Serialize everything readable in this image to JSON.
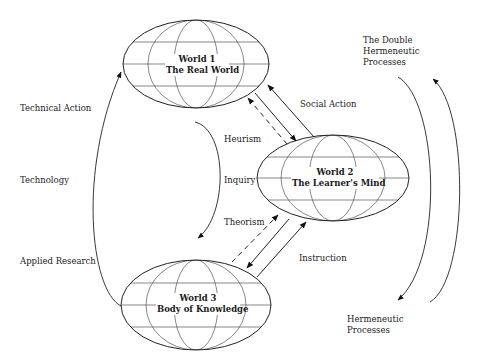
{
  "diagram": {
    "nodes": [
      {
        "id": "world1",
        "title": "World 1",
        "subtitle": "The Real World"
      },
      {
        "id": "world2",
        "title": "World 2",
        "subtitle": "The Learner's Mind"
      },
      {
        "id": "world3",
        "title": "World 3",
        "subtitle": "Body of Knowledge"
      }
    ],
    "edges": [
      {
        "from": "world3",
        "to": "world1",
        "style": "solid-curve",
        "labels": [
          "Technical Action",
          "Technology",
          "Applied Research"
        ]
      },
      {
        "from": "world1",
        "to": "world3",
        "style": "solid-curve-inner",
        "labels": [
          "Heurism",
          "Inquiry",
          "Theorism"
        ]
      },
      {
        "from": "world2",
        "to": "world1",
        "style": "solid",
        "label": "Social Action"
      },
      {
        "from": "world1",
        "to": "world2",
        "style": "solid"
      },
      {
        "from": "world2",
        "to": "world1",
        "style": "dashed"
      },
      {
        "from": "world3",
        "to": "world2",
        "style": "solid",
        "label": "Instruction"
      },
      {
        "from": "world2",
        "to": "world3",
        "style": "solid"
      },
      {
        "from": "world3",
        "to": "world2",
        "style": "dashed"
      }
    ],
    "left_labels": {
      "technical_action": "Technical Action",
      "technology": "Technology",
      "applied_research": "Applied Research"
    },
    "center_labels": {
      "heurism": "Heurism",
      "inquiry": "Inquiry",
      "theorism": "Theorism"
    },
    "connector_labels": {
      "social_action": "Social Action",
      "instruction": "Instruction"
    },
    "right_labels": {
      "double_line1": "The Double",
      "double_line2": "Hermeneutic",
      "double_line3": "Processes",
      "herm_line1": "Hermeneutic",
      "herm_line2": "Processes"
    },
    "colors": {
      "line": "#222222",
      "grid": "#555555",
      "background": "#ffffff"
    }
  }
}
